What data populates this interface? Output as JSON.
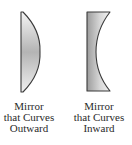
{
  "figure": {
    "mirrors": [
      {
        "id": "convex",
        "shape": "curves-outward",
        "caption_lines": [
          "Mirror",
          "that Curves",
          "Outward"
        ]
      },
      {
        "id": "concave",
        "shape": "curves-inward",
        "caption_lines": [
          "Mirror",
          "that Curves",
          "Inward"
        ]
      }
    ],
    "colors": {
      "outline": "#3a3a3a",
      "fill_light": "#f2f2f2",
      "fill_dark": "#a8a8a8",
      "text": "#2a2a2a",
      "background": "#ffffff"
    }
  }
}
